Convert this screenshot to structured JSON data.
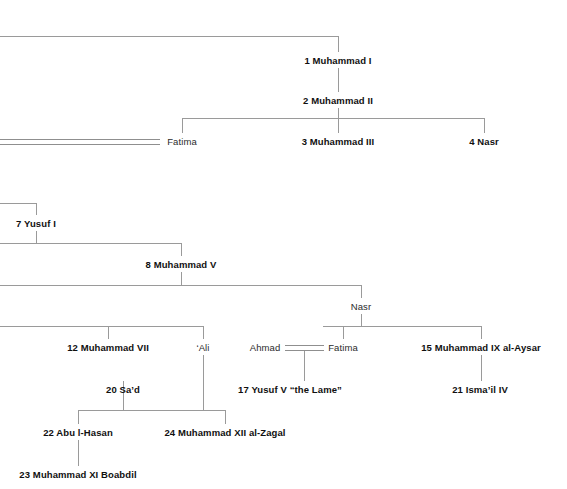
{
  "diagram": {
    "type": "family-tree",
    "line_color": "#9a9a9a",
    "text_color": "#1a1a1a",
    "width": 567,
    "height": 489
  },
  "nodes": [
    {
      "id": "muhammad1",
      "label": "1 Muhammad I",
      "style": "ruler",
      "x": 338,
      "y": 60
    },
    {
      "id": "muhammad2",
      "label": "2 Muhammad II",
      "style": "ruler",
      "x": 338,
      "y": 100
    },
    {
      "id": "fatima1",
      "label": "Fatima",
      "style": "plain",
      "x": 182,
      "y": 141
    },
    {
      "id": "muhammad3",
      "label": "3 Muhammad III",
      "style": "ruler",
      "x": 338,
      "y": 141
    },
    {
      "id": "nasr4",
      "label": "4 Nasr",
      "style": "ruler",
      "x": 484,
      "y": 141
    },
    {
      "id": "yusuf1",
      "label": "7 Yusuf I",
      "style": "ruler",
      "x": 36,
      "y": 223
    },
    {
      "id": "muhammad5",
      "label": "8 Muhammad V",
      "style": "ruler",
      "x": 181,
      "y": 264
    },
    {
      "id": "nasr",
      "label": "Nasr",
      "style": "plain",
      "x": 361,
      "y": 306
    },
    {
      "id": "muhammad7",
      "label": "12 Muhammad VII",
      "style": "ruler",
      "x": 108,
      "y": 347
    },
    {
      "id": "ali",
      "label": "‘Ali",
      "style": "plain",
      "x": 203,
      "y": 347
    },
    {
      "id": "ahmad",
      "label": "Ahmad",
      "style": "plain",
      "x": 265,
      "y": 347
    },
    {
      "id": "fatima2",
      "label": "Fatima",
      "style": "plain",
      "x": 343,
      "y": 347
    },
    {
      "id": "muhammad9",
      "label": "15 Muhammad IX al-Aysar",
      "style": "ruler",
      "x": 481,
      "y": 347
    },
    {
      "id": "sad20",
      "label": "20 Sa’d",
      "style": "ruler",
      "x": 123,
      "y": 389
    },
    {
      "id": "yusuf5",
      "label": "17 Yusuf V “the Lame”",
      "style": "ruler",
      "x": 290,
      "y": 389
    },
    {
      "id": "ismail4",
      "label": "21 Isma’il IV",
      "style": "ruler",
      "x": 480,
      "y": 389
    },
    {
      "id": "abulhasan",
      "label": "22 Abu l-Hasan",
      "style": "ruler",
      "x": 78,
      "y": 432
    },
    {
      "id": "muhammad12",
      "label": "24 Muhammad XII al-Zagal",
      "style": "ruler",
      "x": 225,
      "y": 432
    },
    {
      "id": "boabdil",
      "label": "23 Muhammad XI Boabdil",
      "style": "ruler",
      "x": 78,
      "y": 474
    }
  ],
  "hlines": [
    {
      "id": "top-sibling-bar",
      "x": 0,
      "y": 36,
      "w": 338
    },
    {
      "id": "muhammad2-children-bar",
      "x": 182,
      "y": 118,
      "w": 302
    },
    {
      "id": "yusuf1-parent-bar",
      "x": 0,
      "y": 203,
      "w": 36
    },
    {
      "id": "yusuf1-children-bar",
      "x": 0,
      "y": 243,
      "w": 181
    },
    {
      "id": "muhammad5-children-bar",
      "x": 0,
      "y": 285,
      "w": 361
    },
    {
      "id": "muhammad5-sibling-bar",
      "x": 0,
      "y": 326,
      "w": 203
    },
    {
      "id": "nasr-children-bar",
      "x": 323,
      "y": 326,
      "w": 158
    },
    {
      "id": "ali-children-bar",
      "x": 123,
      "y": 410,
      "w": 102
    },
    {
      "id": "sad-children-bar",
      "x": 78,
      "y": 410,
      "w": 45
    }
  ],
  "vlines": [
    {
      "id": "muhammad1-up",
      "x": 338,
      "y": 36,
      "h": 16
    },
    {
      "id": "muhammad1-down",
      "x": 338,
      "y": 68,
      "h": 24
    },
    {
      "id": "muhammad2-down",
      "x": 338,
      "y": 108,
      "h": 10
    },
    {
      "id": "fatima1-up",
      "x": 182,
      "y": 118,
      "h": 15
    },
    {
      "id": "muhammad3-up",
      "x": 338,
      "y": 118,
      "h": 15
    },
    {
      "id": "nasr4-up",
      "x": 484,
      "y": 118,
      "h": 15
    },
    {
      "id": "yusuf1-up",
      "x": 36,
      "y": 203,
      "h": 12
    },
    {
      "id": "yusuf1-down",
      "x": 36,
      "y": 231,
      "h": 12
    },
    {
      "id": "muhammad5-up",
      "x": 181,
      "y": 243,
      "h": 13
    },
    {
      "id": "muhammad5-down",
      "x": 181,
      "y": 272,
      "h": 13
    },
    {
      "id": "nasr-up",
      "x": 361,
      "y": 285,
      "h": 13
    },
    {
      "id": "nasr-down",
      "x": 361,
      "y": 314,
      "h": 12
    },
    {
      "id": "muhammad7-up",
      "x": 108,
      "y": 326,
      "h": 13
    },
    {
      "id": "ali-up",
      "x": 203,
      "y": 326,
      "h": 13
    },
    {
      "id": "fatima2-up",
      "x": 343,
      "y": 326,
      "h": 13
    },
    {
      "id": "muhammad9-up",
      "x": 481,
      "y": 326,
      "h": 13
    },
    {
      "id": "ali-down",
      "x": 203,
      "y": 355,
      "h": 55
    },
    {
      "id": "ahmad-fatima-down",
      "x": 304,
      "y": 350,
      "h": 31
    },
    {
      "id": "muhammad9-down",
      "x": 481,
      "y": 355,
      "h": 26
    },
    {
      "id": "sad-up",
      "x": 123,
      "y": 381,
      "h": 29
    },
    {
      "id": "abulhasan-up",
      "x": 78,
      "y": 410,
      "h": 14
    },
    {
      "id": "muhammad12-up",
      "x": 225,
      "y": 410,
      "h": 14
    },
    {
      "id": "boabdil-up",
      "x": 78,
      "y": 440,
      "h": 26
    }
  ],
  "marriages": [
    {
      "id": "fatima1-marriage",
      "x": 0,
      "y": 139,
      "w": 160
    },
    {
      "id": "ahmad-fatima-marriage",
      "x": 285,
      "y": 345,
      "w": 39
    }
  ]
}
